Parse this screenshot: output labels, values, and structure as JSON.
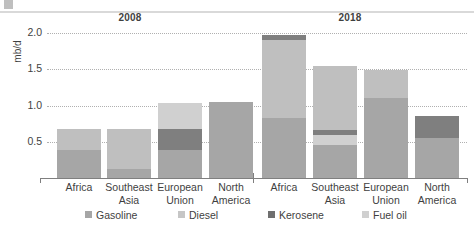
{
  "chart_data": {
    "type": "bar",
    "title": "",
    "subtitle": "",
    "xlabel": "",
    "ylabel": "mb/d",
    "ylim": [
      0,
      2.0
    ],
    "ytick_labels": [
      "0.5",
      "1.0",
      "1.5",
      "2.0"
    ],
    "ytick_values": [
      0.5,
      1.0,
      1.5,
      2.0
    ],
    "grid": true,
    "stacked": true,
    "legend_position": "bottom",
    "group_labels": [
      "2008",
      "2018"
    ],
    "categories": [
      "Africa",
      "Southeast Asia",
      "European Union",
      "North America",
      "Africa",
      "Southeast Asia",
      "European Union",
      "North America"
    ],
    "category_lines": [
      [
        "Africa",
        ""
      ],
      [
        "Southeast",
        "Asia"
      ],
      [
        "European",
        "Union"
      ],
      [
        "North",
        "America"
      ],
      [
        "Africa",
        ""
      ],
      [
        "Southeast",
        "Asia"
      ],
      [
        "European",
        "Union"
      ],
      [
        "North",
        "America"
      ]
    ],
    "series": [
      {
        "name": "Gasoline",
        "color": "#a6a6a6",
        "values": [
          0.38,
          0.12,
          0.38,
          1.05,
          0.83,
          0.45,
          1.1,
          0.55
        ]
      },
      {
        "name": "Diesel",
        "color": "#bfbfbf",
        "values": [
          0.29,
          0.55,
          0.0,
          0.0,
          1.08,
          0.88,
          0.39,
          0.0
        ]
      },
      {
        "name": "Kerosene",
        "color": "#7f7f7f",
        "values": [
          0.0,
          0.0,
          0.3,
          0.0,
          0.06,
          0.07,
          0.0,
          0.31
        ]
      },
      {
        "name": "Fuel oil",
        "color": "#d0d0d0",
        "values": [
          0.0,
          0.0,
          0.35,
          0.0,
          0.0,
          0.14,
          0.0,
          0.0
        ]
      }
    ],
    "totals": [
      0.67,
      0.67,
      1.03,
      1.05,
      1.97,
      1.54,
      1.49,
      0.86
    ],
    "stack_order": [
      [
        "Gasoline",
        "Diesel"
      ],
      [
        "Gasoline",
        "Diesel"
      ],
      [
        "Gasoline",
        "Kerosene",
        "Fuel oil"
      ],
      [
        "Gasoline"
      ],
      [
        "Gasoline",
        "Diesel",
        "Kerosene"
      ],
      [
        "Gasoline",
        "Fuel oil",
        "Kerosene",
        "Diesel"
      ],
      [
        "Gasoline",
        "Diesel"
      ],
      [
        "Gasoline",
        "Kerosene"
      ]
    ]
  },
  "legend": {
    "items": [
      {
        "label": "Gasoline",
        "color": "#a6a6a6"
      },
      {
        "label": "Diesel",
        "color": "#c6c6c6"
      },
      {
        "label": "Kerosene",
        "color": "#6f6f6f"
      },
      {
        "label": "Fuel oil",
        "color": "#d0d0d0"
      }
    ]
  }
}
